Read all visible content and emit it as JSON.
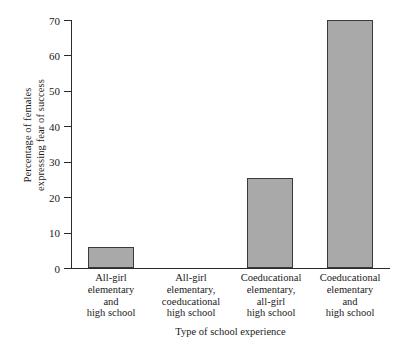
{
  "chart_data": {
    "type": "bar",
    "title": "",
    "xlabel": "Type of school experience",
    "ylabel": "Percentage of females expressing fear of success",
    "ylabel_lines": [
      "Percentage of females",
      "expressing fear of success"
    ],
    "categories": [
      "All-girl elementary and high school",
      "All-girl elementary, coeducational high school",
      "Coeducational elementary, all-girl high school",
      "Coeducational elementary and high school"
    ],
    "category_lines": [
      [
        "All-girl",
        "elementary",
        "and",
        "high school"
      ],
      [
        "All-girl",
        "elementary,",
        "coeducational",
        "high school"
      ],
      [
        "Coeducational",
        "elementary,",
        "all-girl",
        "high school"
      ],
      [
        "Coeducational",
        "elementary",
        "and",
        "high school"
      ]
    ],
    "values": [
      6,
      0,
      25.5,
      70
    ],
    "ylim": [
      0,
      70
    ],
    "yticks": [
      0,
      10,
      20,
      30,
      40,
      50,
      60,
      70
    ],
    "ytick_labels": [
      "0",
      "10",
      "20",
      "30",
      "40",
      "50",
      "60",
      "70"
    ],
    "grid": false,
    "legend": null,
    "bar_color": "#a9a9a9",
    "bar_border_color": "#3a3a3a",
    "axis_color": "#2b2b2b"
  }
}
